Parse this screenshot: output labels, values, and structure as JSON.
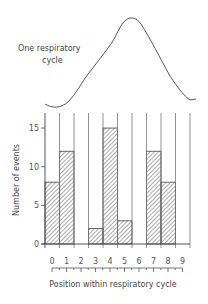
{
  "curve_label": {
    "line1": "One  respiratory",
    "line2": "cycle"
  },
  "chart_data": {
    "type": "bar",
    "title": "",
    "xlabel": "Position within respiratory cycle",
    "ylabel": "Number of events",
    "categories": [
      "0",
      "1",
      "2",
      "3",
      "4",
      "5",
      "6",
      "7",
      "8",
      "9"
    ],
    "values": [
      8,
      12,
      0,
      2,
      15,
      3,
      0,
      12,
      8,
      0
    ],
    "yticks": [
      "0",
      "5",
      "10",
      "15"
    ],
    "xticks": [
      "0",
      "1",
      "2",
      "3",
      "4",
      "5",
      "6",
      "7",
      "8",
      "9"
    ],
    "ylim": [
      0,
      17
    ],
    "grid": "vertical bin lines",
    "bar_fill": "diagonal hatch",
    "annotation": "One respiratory cycle (waveform above histogram)"
  }
}
